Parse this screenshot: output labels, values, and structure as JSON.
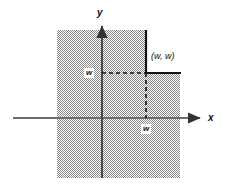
{
  "figure": {
    "background_color": "#ffffff",
    "shading_color": "#808080",
    "line_color": "#111111",
    "axis_color": "#555555"
  },
  "axes": {
    "x_label": "x",
    "y_label": "y",
    "origin": {
      "x": 102,
      "y": 118
    },
    "x_axis": {
      "start_x": 13,
      "end_x": 205,
      "y": 118,
      "arrow": "right"
    },
    "y_axis": {
      "x": 102,
      "start_y": 22,
      "end_y": 178,
      "arrow": "up"
    }
  },
  "region": {
    "name": "shaded-region",
    "left": 57,
    "top": 30,
    "right": 180,
    "bottom": 178,
    "notch": {
      "left": 146,
      "top": 30,
      "right": 180,
      "bottom": 73
    },
    "fill": "hatch-gray"
  },
  "labels": {
    "point": "(w, w)",
    "y_tick": "w",
    "x_tick": "w"
  },
  "guides": {
    "horizontal_dashed": {
      "from_x": 102,
      "to_x": 146,
      "y": 73
    },
    "vertical_dashed": {
      "x": 146,
      "from_y": 73,
      "to_y": 118
    },
    "solid_vertical": {
      "x": 146,
      "from_y": 30,
      "to_y": 73
    },
    "solid_horizontal": {
      "y": 73,
      "from_x": 146,
      "to_x": 180
    }
  }
}
